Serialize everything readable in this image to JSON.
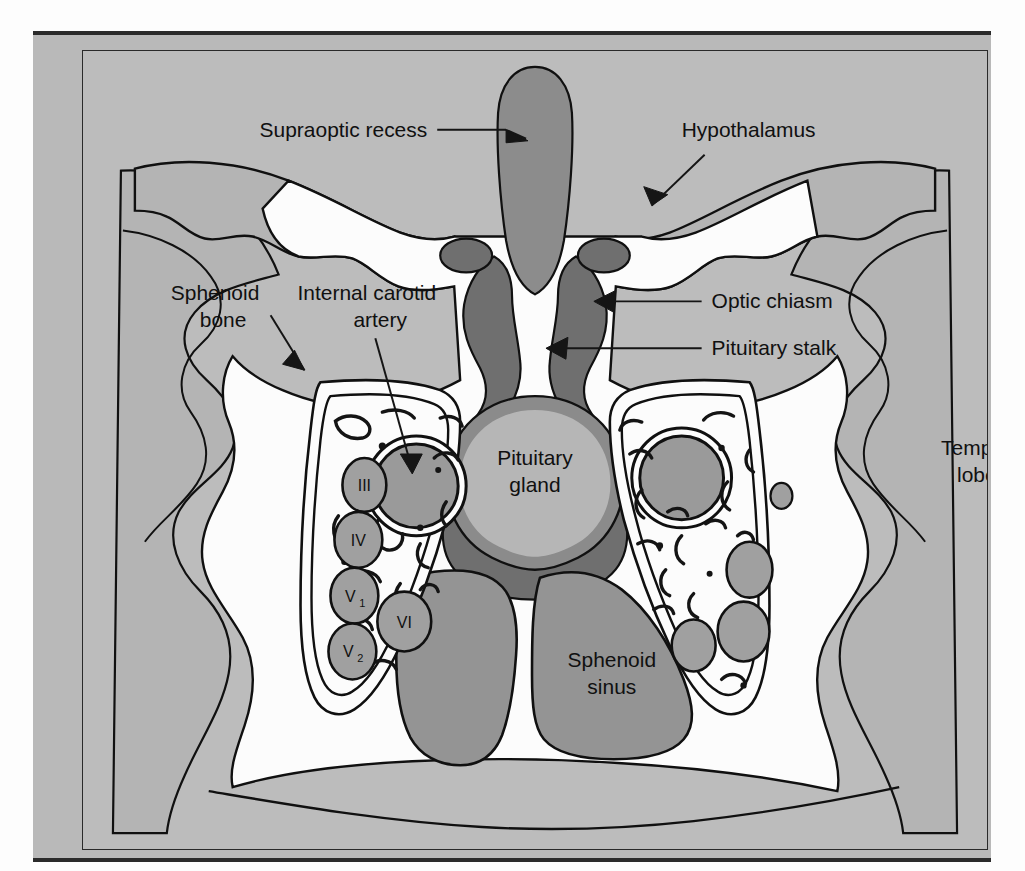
{
  "figure": {
    "title_visible": false,
    "type": "anatomical-cross-section",
    "region": "Coronal section through the sella turcica and cavernous sinus",
    "background_color": "#bcbcbc",
    "mat_color": "#b9b9b9",
    "outline_color": "#101010"
  },
  "palette": {
    "page_gray": "#b9b9b9",
    "figure_gray": "#bcbcbc",
    "brain_gray": "#b4b4b4",
    "white_space": "#fcfcfc",
    "mid_gray": "#949494",
    "dark_gray": "#6f6f6f",
    "nerve_gray": "#a0a0a0",
    "outline": "#101010"
  },
  "labels": [
    {
      "id": "supraoptic-recess",
      "text": "Supraoptic recess",
      "lines": [
        "Supraoptic recess"
      ],
      "x": 177,
      "y": 86,
      "anchor": "start",
      "has_arrow": true
    },
    {
      "id": "hypothalamus",
      "text": "Hypothalamus",
      "lines": [
        "Hypothalamus"
      ],
      "x": 600,
      "y": 86,
      "anchor": "start",
      "has_arrow": true
    },
    {
      "id": "sphenoid-bone",
      "text": "Sphenoid bone",
      "lines": [
        "Sphenoid",
        "bone"
      ],
      "x": 88,
      "y": 250,
      "anchor": "start",
      "has_arrow": true
    },
    {
      "id": "internal-carotid-artery",
      "text": "Internal carotid artery",
      "lines": [
        "Internal carotid",
        "artery"
      ],
      "x": 215,
      "y": 250,
      "anchor": "start",
      "has_arrow": true
    },
    {
      "id": "optic-chiasm",
      "text": "Optic chiasm",
      "lines": [
        "Optic chiasm"
      ],
      "x": 630,
      "y": 258,
      "anchor": "start",
      "has_arrow": true
    },
    {
      "id": "pituitary-stalk",
      "text": "Pituitary stalk",
      "lines": [
        "Pituitary stalk"
      ],
      "x": 630,
      "y": 305,
      "anchor": "start",
      "has_arrow": true
    },
    {
      "id": "pituitary-gland",
      "text": "Pituitary gland",
      "lines": [
        "Pituitary",
        "gland"
      ],
      "x": 453,
      "y": 385,
      "anchor": "middle",
      "has_arrow": false
    },
    {
      "id": "temporal-lobe",
      "text": "Temporal lobe",
      "lines": [
        "Temporal",
        "lobe"
      ],
      "x": 860,
      "y": 405,
      "anchor": "start",
      "has_arrow": false
    },
    {
      "id": "sphenoid-sinus",
      "text": "Sphenoid sinus",
      "lines": [
        "Sphenoid",
        "sinus"
      ],
      "x": 562,
      "y": 600,
      "anchor": "middle",
      "has_arrow": false
    }
  ],
  "cranial_nerves": [
    {
      "id": "nerve-III",
      "label": "III",
      "sub": "",
      "full_name": "Oculomotor nerve",
      "cx": 282,
      "cy": 435,
      "rx": 22,
      "ry": 27
    },
    {
      "id": "nerve-IV",
      "label": "IV",
      "sub": "",
      "full_name": "Trochlear nerve",
      "cx": 276,
      "cy": 490,
      "rx": 24,
      "ry": 28
    },
    {
      "id": "nerve-V1",
      "label": "V",
      "sub": "1",
      "full_name": "Ophthalmic division of trigeminal nerve",
      "cx": 272,
      "cy": 546,
      "rx": 24,
      "ry": 28
    },
    {
      "id": "nerve-V2",
      "label": "V",
      "sub": "2",
      "full_name": "Maxillary division of trigeminal nerve",
      "cx": 270,
      "cy": 602,
      "rx": 24,
      "ry": 28
    },
    {
      "id": "nerve-VI",
      "label": "VI",
      "sub": "",
      "full_name": "Abducens nerve",
      "cx": 322,
      "cy": 572,
      "rx": 27,
      "ry": 30
    }
  ],
  "structures": [
    {
      "id": "supraoptic-recess-shape",
      "name": "Supraoptic recess",
      "fill": "#8c8c8c"
    },
    {
      "id": "optic-chiasm-left",
      "name": "Optic chiasm (left)",
      "fill": "#6f6f6f"
    },
    {
      "id": "optic-chiasm-right",
      "name": "Optic chiasm (right)",
      "fill": "#6f6f6f"
    },
    {
      "id": "pituitary-stalk-shape",
      "name": "Pituitary stalk",
      "fill": "#6f6f6f"
    },
    {
      "id": "pituitary-gland-shape",
      "name": "Pituitary gland",
      "fill": "#b6b6b6",
      "rim": "#8b8b8b"
    },
    {
      "id": "sphenoid-sinus-left",
      "name": "Sphenoid sinus (left lobe)",
      "fill": "#949494"
    },
    {
      "id": "sphenoid-sinus-right",
      "name": "Sphenoid sinus (right lobe)",
      "fill": "#949494"
    },
    {
      "id": "temporal-lobe-left",
      "name": "Temporal lobe (left)",
      "fill": "#b4b4b4"
    },
    {
      "id": "temporal-lobe-right",
      "name": "Temporal lobe (right)",
      "fill": "#b4b4b4"
    },
    {
      "id": "carotid-artery-left",
      "name": "Internal carotid artery (left)",
      "fill": "#9a9a9a"
    },
    {
      "id": "carotid-artery-right",
      "name": "Internal carotid artery (right)",
      "fill": "#9a9a9a"
    },
    {
      "id": "cavernous-sinus-left",
      "name": "Cavernous sinus (left)",
      "fill": "#fcfcfc"
    },
    {
      "id": "cavernous-sinus-right",
      "name": "Cavernous sinus (right)",
      "fill": "#fcfcfc"
    },
    {
      "id": "sphenoid-bone-shape",
      "name": "Sphenoid bone",
      "fill": "#fcfcfc"
    }
  ]
}
